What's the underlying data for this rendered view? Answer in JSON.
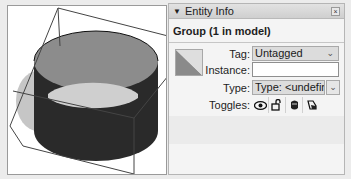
{
  "viewport": {
    "description": "3D model view of a hollow cylinder group with bounding box",
    "colors": {
      "cylinder_outer": "#2a2a2a",
      "cylinder_inner": "#8c8c8c",
      "cylinder_floor": "#cfcfcf",
      "shadow": "#b8b8b8",
      "bounding_box": "#444444"
    }
  },
  "entity_info": {
    "header": {
      "collapse_icon": "triangle-down-icon",
      "title": "Entity Info",
      "close_icon": "close-icon"
    },
    "subtitle": "Group (1 in model)",
    "thumbnail_icon": "material-swatch-icon",
    "tag": {
      "label": "Tag:",
      "value": "Untagged"
    },
    "instance": {
      "label": "Instance:",
      "value": ""
    },
    "type": {
      "label": "Type:",
      "value": "Type: <undefined:"
    },
    "toggles": {
      "label": "Toggles:",
      "items": [
        {
          "name": "visibility",
          "icon": "eye-icon"
        },
        {
          "name": "lock",
          "icon": "lock-icon"
        },
        {
          "name": "receive-shadows",
          "icon": "receive-shadows-icon"
        },
        {
          "name": "cast-shadows",
          "icon": "cast-shadows-icon"
        }
      ]
    }
  }
}
